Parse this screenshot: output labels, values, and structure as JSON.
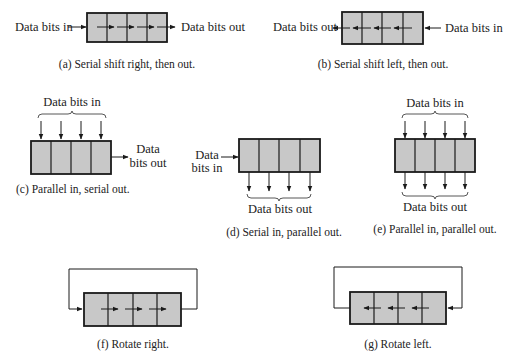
{
  "figure": {
    "panels": [
      {
        "id": "a",
        "caption": "(a) Serial shift right, then out.",
        "input_label": "Data bits in",
        "output_label": "Data bits out",
        "cells": 4,
        "direction": "right"
      },
      {
        "id": "b",
        "caption": "(b) Serial shift left, then out.",
        "input_label": "Data bits in",
        "output_label": "Data bits out",
        "cells": 4,
        "direction": "left"
      },
      {
        "id": "c",
        "caption": "(c) Parallel in, serial out.",
        "input_label": "Data bits in",
        "output_label_line1": "Data",
        "output_label_line2": "bits out",
        "cells": 4
      },
      {
        "id": "d",
        "caption": "(d) Serial in, parallel out.",
        "input_label_line1": "Data",
        "input_label_line2": "bits in",
        "output_label": "Data bits out",
        "cells": 4
      },
      {
        "id": "e",
        "caption": "(e) Parallel in, parallel out.",
        "input_label": "Data bits in",
        "output_label": "Data bits out",
        "cells": 4
      },
      {
        "id": "f",
        "caption": "(f) Rotate right.",
        "cells": 4,
        "direction": "right"
      },
      {
        "id": "g",
        "caption": "(g) Rotate left.",
        "cells": 4,
        "direction": "left"
      }
    ],
    "colors": {
      "cell_fill": "#c8c8c8",
      "stroke": "#1a1a1a",
      "background": "#ffffff"
    }
  }
}
